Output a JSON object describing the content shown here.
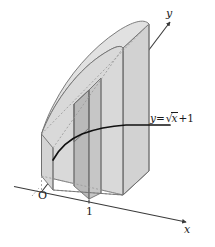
{
  "figure": {
    "background_color": "#ffffff",
    "axes": {
      "x_label": "x",
      "y_label": "y",
      "origin_label": "O",
      "tick_labels": [
        "1"
      ],
      "axis_color": "#3a3a3a",
      "arrow_style": "solid-arrowhead"
    },
    "curve": {
      "equation_label_parts": {
        "lhs": "y",
        "equals": "=",
        "radical_sign": "√",
        "radicand": "x",
        "plus_one": "+1"
      },
      "equation_plain": "y=√x+1",
      "curve_color": "#111111",
      "curve_width": 1.8
    },
    "solid": {
      "fill_light": "#dcdcdc",
      "fill_mid": "#cfcfcf",
      "fill_dark": "#b9b9b9",
      "fill_top": "#e2e2e2",
      "edge_color": "#6f6f6f",
      "hidden_edge_color": "#9a9a9a",
      "hidden_edge_dash": "2,2",
      "cross_section_count": 2,
      "description": "Solid of known cross sections: curved sheet rising from the x-axis to the curve with two highlighted vertical slab cross sections at x between 0 and 1"
    },
    "colors": {
      "ink": "#1a1a1a",
      "line": "#555555",
      "paper": "#ffffff"
    }
  }
}
